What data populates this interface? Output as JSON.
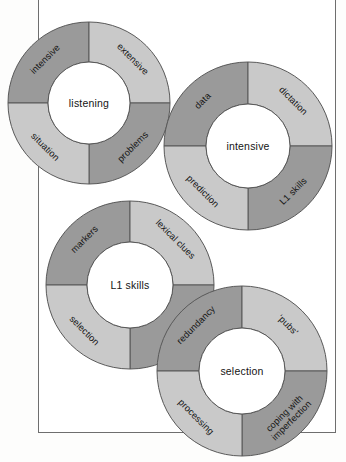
{
  "figure": {
    "type": "diagram",
    "kind": "four-overlapping-donut-rings",
    "colors": {
      "dark_segment": "#9a9a9a",
      "light_segment": "#c9c9c9",
      "hub_fill": "#ffffff",
      "stroke": "#595959",
      "page_background": "#fdfdfc",
      "frame_stroke": "#6e6e6e",
      "text": "#141414"
    },
    "rings": [
      {
        "id": "ring-listening",
        "center_label": "listening",
        "cx": 89,
        "cy": 103,
        "r_outer": 81,
        "r_inner": 41,
        "segments": [
          {
            "position": "top-left",
            "label": "intensive",
            "shade": "dark"
          },
          {
            "position": "top-right",
            "label": "extensive",
            "shade": "light"
          },
          {
            "position": "bottom-right",
            "label": "problems",
            "shade": "dark"
          },
          {
            "position": "bottom-left",
            "label": "situation",
            "shade": "light"
          }
        ]
      },
      {
        "id": "ring-intensive",
        "center_label": "intensive",
        "cx": 248,
        "cy": 146,
        "r_outer": 84,
        "r_inner": 42,
        "segments": [
          {
            "position": "top-left",
            "label": "data",
            "shade": "dark"
          },
          {
            "position": "top-right",
            "label": "dictation",
            "shade": "light"
          },
          {
            "position": "bottom-right",
            "label": "L1 skills",
            "shade": "dark"
          },
          {
            "position": "bottom-left",
            "label": "prediction",
            "shade": "light"
          }
        ]
      },
      {
        "id": "ring-l1-skills",
        "center_label": "L1 skills",
        "cx": 130,
        "cy": 285,
        "r_outer": 84,
        "r_inner": 43,
        "segments": [
          {
            "position": "top-left",
            "label": "markers",
            "shade": "dark"
          },
          {
            "position": "top-right",
            "label": "lexical clues",
            "shade": "light"
          },
          {
            "position": "bottom-right",
            "label": "",
            "shade": "dark"
          },
          {
            "position": "bottom-left",
            "label": "selection",
            "shade": "light"
          }
        ]
      },
      {
        "id": "ring-selection",
        "center_label": "selection",
        "cx": 242,
        "cy": 371,
        "r_outer": 85,
        "r_inner": 43,
        "segments": [
          {
            "position": "top-left",
            "label": "redundancy",
            "shade": "dark"
          },
          {
            "position": "top-right",
            "label": "‘pubs’",
            "shade": "light"
          },
          {
            "position": "bottom-right",
            "label": "coping with\nimperfection",
            "shade": "dark"
          },
          {
            "position": "bottom-left",
            "label": "processing",
            "shade": "light"
          }
        ]
      }
    ]
  }
}
